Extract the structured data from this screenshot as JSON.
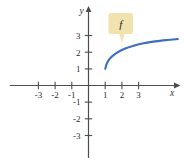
{
  "chart_data": {
    "type": "line",
    "title": "",
    "xlabel": "x",
    "ylabel": "y",
    "grid": false,
    "legend": "none",
    "xlim": [
      -3.8,
      5.4
    ],
    "ylim": [
      -3.6,
      3.6
    ],
    "x_ticks": [
      -3,
      -2,
      -1,
      1,
      2,
      3
    ],
    "y_ticks": [
      -3,
      -2,
      -1,
      1,
      2,
      3
    ],
    "x_tick_labels": [
      "-3",
      "-2",
      "-1",
      "1",
      "2",
      "3"
    ],
    "y_tick_labels": [
      "-3",
      "-2",
      "-1",
      "1",
      "2",
      "3"
    ],
    "annotations": [
      {
        "text": "f",
        "type": "callout",
        "x": 1.45,
        "y": 2.95
      }
    ],
    "series": [
      {
        "name": "f",
        "color": "#3d6fc0",
        "points": [
          {
            "x": 1.0,
            "y": 1.0
          },
          {
            "x": 1.1,
            "y": 1.32
          },
          {
            "x": 1.25,
            "y": 1.58
          },
          {
            "x": 1.5,
            "y": 1.82
          },
          {
            "x": 1.8,
            "y": 2.02
          },
          {
            "x": 2.2,
            "y": 2.21
          },
          {
            "x": 2.7,
            "y": 2.38
          },
          {
            "x": 3.3,
            "y": 2.53
          },
          {
            "x": 4.0,
            "y": 2.64
          },
          {
            "x": 4.7,
            "y": 2.72
          },
          {
            "x": 5.35,
            "y": 2.78
          }
        ]
      }
    ]
  },
  "axes": {
    "x_axis_label": "x",
    "y_axis_label": "y",
    "x_labels": [
      "-3",
      "-2",
      "-1",
      "1",
      "2",
      "3"
    ],
    "y_labels": [
      "3",
      "2",
      "1",
      "-1",
      "-2",
      "-3"
    ]
  },
  "callout": {
    "label": "f",
    "fill": "#f2e3ae",
    "shadow": "#d8c590"
  },
  "colors": {
    "curve": "#3d6fc0",
    "axis": "#4d4d4d",
    "text": "#2b2b2b",
    "background": "#ffffff"
  }
}
